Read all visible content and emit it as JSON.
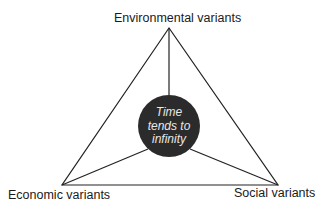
{
  "diagram": {
    "type": "triangle-with-center",
    "vertices": {
      "top": {
        "label": "Environmental variants"
      },
      "bottom_left": {
        "label": "Economic variants"
      },
      "bottom_right": {
        "label": "Social variants"
      }
    },
    "center": {
      "lines": [
        "Time",
        "tends to",
        "infinity"
      ],
      "fill": "#2b2b2b"
    },
    "stroke": "#222222"
  }
}
